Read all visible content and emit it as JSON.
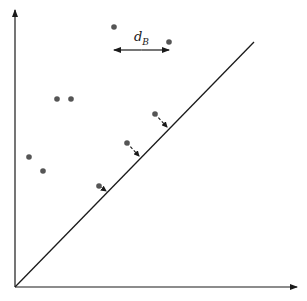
{
  "diagram": {
    "axes": {
      "origin": [
        15,
        287
      ],
      "x_end": [
        297,
        287
      ],
      "y_end": [
        15,
        10
      ]
    },
    "diagonal": {
      "from": [
        15,
        287
      ],
      "to": [
        254,
        42
      ]
    },
    "points": [
      {
        "x": 114,
        "y": 27
      },
      {
        "x": 169,
        "y": 42
      },
      {
        "x": 57,
        "y": 99
      },
      {
        "x": 71,
        "y": 99
      },
      {
        "x": 29,
        "y": 157
      },
      {
        "x": 43,
        "y": 171
      },
      {
        "x": 155,
        "y": 114
      },
      {
        "x": 127,
        "y": 143
      },
      {
        "x": 99,
        "y": 186
      }
    ],
    "projections": [
      {
        "from": [
          155,
          114
        ],
        "to": [
          167,
          127
        ]
      },
      {
        "from": [
          127,
          143
        ],
        "to": [
          139,
          156
        ]
      },
      {
        "from": [
          99,
          186
        ],
        "to": [
          106,
          191
        ]
      }
    ],
    "distance_arrow": {
      "from": [
        114,
        50
      ],
      "to": [
        169,
        50
      ]
    },
    "label": {
      "main": "d",
      "sub": "B"
    },
    "colors": {
      "point": "#555555",
      "line": "#1a1a1a"
    }
  }
}
